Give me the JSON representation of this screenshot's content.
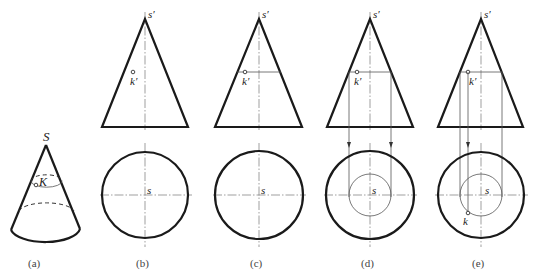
{
  "figure": {
    "panels": [
      {
        "id": "a",
        "caption": "(a)",
        "apex_label": "S",
        "point_label": "K"
      },
      {
        "id": "b",
        "caption": "(b)",
        "apex_label": "s′",
        "point_label": "k′",
        "center_label": "s"
      },
      {
        "id": "c",
        "caption": "(c)",
        "apex_label": "s′",
        "point_label": "k′",
        "center_label": "s"
      },
      {
        "id": "d",
        "caption": "(d)",
        "apex_label": "s′",
        "point_label": "k′",
        "center_label": "s"
      },
      {
        "id": "e",
        "caption": "(e)",
        "apex_label": "s′",
        "point_label": "k′",
        "center_label": "s",
        "plan_point_label": "k"
      }
    ]
  }
}
